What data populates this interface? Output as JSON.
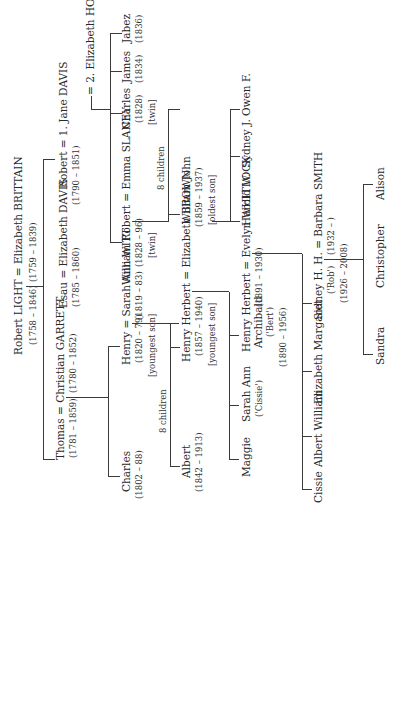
{
  "gen1": {
    "couple": "Robert LIGHT = Elizabeth BRITTAIN",
    "dates_left": "(1758 – 1846)",
    "dates_right": "(1759 – 1839)"
  },
  "gen2": {
    "thomas": {
      "couple": "Thomas = Christian GARRETT",
      "dates_left": "(1781 – 1859)",
      "dates_right": "(1780 – 1852)"
    },
    "esau": {
      "couple": "Esau = Elizabeth DAVIS",
      "dates": "(1785 – 1860)"
    },
    "robert": {
      "couple": "Robert = 1. Jane DAVIS",
      "dates": "(1790 – 1851)",
      "second_wife": "= 2. Elizabeth HOAR"
    }
  },
  "gen3": {
    "charles_a": {
      "name": "Charles",
      "dates": "(1802 – 88)"
    },
    "henry": {
      "couple": "Henry = Sarah Ann WITT",
      "dates_left": "(1820 – 79)",
      "dates_right": "(1819 – 83)",
      "note": "[youngest son]"
    },
    "william_robert": {
      "couple": "William Robert = Emma SLANEY",
      "dates": "(1828 – 96)",
      "note": "[twin]"
    },
    "charles_b": {
      "name": "Charles",
      "dates": "(1828)",
      "note": "[twin]"
    },
    "james": {
      "name": "James",
      "dates": "(1834)"
    },
    "jabez": {
      "name": "Jabez",
      "dates": "(1836)"
    }
  },
  "gen4": {
    "henry_children_label": "8 children",
    "albert": {
      "name": "Albert",
      "dates": "(1842 – 1913)"
    },
    "henry_herbert": {
      "couple": "Henry Herbert = Elizabeth BROWN",
      "dates": "(1857 – 1940)",
      "note": "[youngest son]"
    },
    "wr_children_label": "8 children",
    "william_john": {
      "name": "William John",
      "dates": "(1859 – 1937)",
      "note": "[oldest son]"
    }
  },
  "gen5": {
    "maggie": {
      "name": "Maggie"
    },
    "sarah_ann": {
      "name": "Sarah Ann",
      "nick": "('Cissie')"
    },
    "hha": {
      "couple": "Henry Herbert = Evelyn WHITLOCK",
      "name2": "Archibald",
      "nick": "('Bert')",
      "dates_left": "(1890 – 1956)",
      "dates_right": "(1891 – 1930)"
    },
    "harold": {
      "name": "Harold W."
    },
    "sydney_j": {
      "name": "Sydney J."
    },
    "owen": {
      "name": "Owen F."
    }
  },
  "gen6": {
    "cissie": {
      "name": "Cissie"
    },
    "albert_william": {
      "name": "Albert William"
    },
    "elizabeth_margaret": {
      "name": "Elizabeth Margaret"
    },
    "sidney": {
      "couple": "Sidney H. H. = Barbara SMITH",
      "nick": "('Rob')",
      "dates_left": "(1926 – 2008)",
      "dates_right": "(1932 – )"
    }
  },
  "gen7": {
    "sandra": {
      "name": "Sandra"
    },
    "christopher": {
      "name": "Christopher"
    },
    "alison": {
      "name": "Alison"
    }
  }
}
